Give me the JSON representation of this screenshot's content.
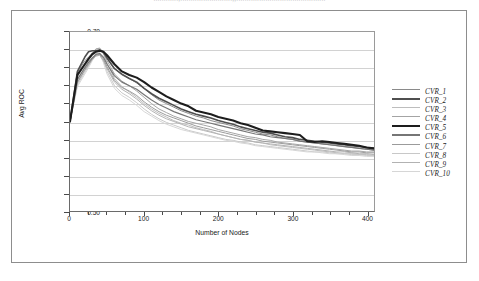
{
  "figure": {
    "caption_cutoff": "............,.........................,,..........................................."
  },
  "chart_data": {
    "type": "line",
    "title": "",
    "xlabel": "Number of Nodes",
    "ylabel": "Avg ROC",
    "xlim": [
      0,
      410
    ],
    "ylim": [
      0.5,
      0.7
    ],
    "ytick_values": [
      0.5,
      0.52,
      0.54,
      0.56,
      0.58,
      0.6,
      0.62,
      0.64,
      0.66,
      0.68,
      0.7
    ],
    "ytick_labels": [
      "0.50",
      "0.52",
      "0.54",
      "0.56",
      "0.58",
      "0.60",
      "0.62",
      "0.64",
      "0.66",
      "0.68",
      "0.70"
    ],
    "xtick_values": [
      0,
      100,
      200,
      300,
      400
    ],
    "xtick_labels": [
      "0",
      "100",
      "200",
      "300",
      "400"
    ],
    "xminor_step": 25,
    "grid": "horizontal",
    "legend_position": "right",
    "legend_entries": [
      "CVR_1",
      "CVR_2",
      "CVR_3",
      "CVR_4",
      "CVR_5",
      "CVR_6",
      "CVR_7",
      "CVR_8",
      "CVR_9",
      "CVR_10"
    ],
    "x": [
      0,
      10,
      20,
      25,
      30,
      35,
      40,
      45,
      50,
      60,
      70,
      80,
      90,
      100,
      110,
      120,
      130,
      140,
      150,
      160,
      170,
      180,
      190,
      200,
      210,
      220,
      230,
      240,
      250,
      260,
      270,
      280,
      290,
      300,
      310,
      320,
      330,
      340,
      350,
      360,
      370,
      380,
      390,
      400,
      410
    ],
    "series": [
      {
        "name": "CVR_1",
        "color": "#8a8a8a",
        "width": 1.0,
        "values": [
          0.6,
          0.655,
          0.668,
          0.672,
          0.676,
          0.679,
          0.68,
          0.676,
          0.67,
          0.659,
          0.652,
          0.648,
          0.643,
          0.637,
          0.63,
          0.624,
          0.62,
          0.616,
          0.612,
          0.609,
          0.606,
          0.604,
          0.601,
          0.599,
          0.597,
          0.595,
          0.592,
          0.59,
          0.588,
          0.586,
          0.585,
          0.583,
          0.581,
          0.58,
          0.578,
          0.577,
          0.576,
          0.575,
          0.574,
          0.573,
          0.572,
          0.571,
          0.57,
          0.569,
          0.568
        ]
      },
      {
        "name": "CVR_2",
        "color": "#4f4f4f",
        "width": 1.6,
        "values": [
          0.6,
          0.656,
          0.672,
          0.678,
          0.679,
          0.679,
          0.68,
          0.678,
          0.671,
          0.659,
          0.653,
          0.648,
          0.644,
          0.637,
          0.631,
          0.626,
          0.622,
          0.618,
          0.614,
          0.611,
          0.608,
          0.606,
          0.604,
          0.601,
          0.599,
          0.597,
          0.594,
          0.592,
          0.59,
          0.588,
          0.587,
          0.585,
          0.583,
          0.582,
          0.58,
          0.579,
          0.578,
          0.577,
          0.576,
          0.575,
          0.574,
          0.573,
          0.572,
          0.571,
          0.57
        ]
      },
      {
        "name": "CVR_3",
        "color": "#bdbdbd",
        "width": 1.0,
        "values": [
          0.6,
          0.646,
          0.661,
          0.668,
          0.676,
          0.681,
          0.682,
          0.676,
          0.665,
          0.648,
          0.639,
          0.633,
          0.627,
          0.62,
          0.614,
          0.609,
          0.605,
          0.601,
          0.598,
          0.596,
          0.593,
          0.591,
          0.589,
          0.586,
          0.584,
          0.582,
          0.58,
          0.579,
          0.577,
          0.576,
          0.574,
          0.573,
          0.572,
          0.571,
          0.57,
          0.569,
          0.568,
          0.567,
          0.566,
          0.565,
          0.564,
          0.564,
          0.563,
          0.563,
          0.562
        ]
      },
      {
        "name": "CVR_4",
        "color": "#a4a4a4",
        "width": 1.0,
        "values": [
          0.6,
          0.65,
          0.665,
          0.671,
          0.677,
          0.681,
          0.682,
          0.677,
          0.668,
          0.653,
          0.645,
          0.64,
          0.634,
          0.627,
          0.62,
          0.614,
          0.61,
          0.606,
          0.603,
          0.6,
          0.598,
          0.596,
          0.594,
          0.591,
          0.589,
          0.587,
          0.585,
          0.583,
          0.582,
          0.58,
          0.579,
          0.577,
          0.576,
          0.575,
          0.574,
          0.573,
          0.572,
          0.571,
          0.57,
          0.569,
          0.568,
          0.567,
          0.567,
          0.566,
          0.566
        ]
      },
      {
        "name": "CVR_5",
        "color": "#1d1d1d",
        "width": 2.1,
        "values": [
          0.6,
          0.652,
          0.664,
          0.67,
          0.675,
          0.678,
          0.679,
          0.678,
          0.674,
          0.664,
          0.656,
          0.652,
          0.649,
          0.644,
          0.638,
          0.633,
          0.628,
          0.624,
          0.62,
          0.617,
          0.612,
          0.61,
          0.608,
          0.605,
          0.603,
          0.601,
          0.598,
          0.596,
          0.593,
          0.59,
          0.589,
          0.588,
          0.587,
          0.586,
          0.585,
          0.578,
          0.577,
          0.578,
          0.577,
          0.576,
          0.575,
          0.574,
          0.573,
          0.571,
          0.57
        ]
      },
      {
        "name": "CVR_6",
        "color": "#767676",
        "width": 1.2,
        "values": [
          0.6,
          0.647,
          0.66,
          0.666,
          0.671,
          0.675,
          0.676,
          0.672,
          0.664,
          0.651,
          0.644,
          0.64,
          0.636,
          0.63,
          0.624,
          0.619,
          0.615,
          0.611,
          0.608,
          0.605,
          0.602,
          0.6,
          0.598,
          0.596,
          0.594,
          0.592,
          0.59,
          0.588,
          0.586,
          0.585,
          0.583,
          0.582,
          0.581,
          0.58,
          0.578,
          0.577,
          0.576,
          0.575,
          0.574,
          0.573,
          0.572,
          0.571,
          0.57,
          0.569,
          0.568
        ]
      },
      {
        "name": "CVR_7",
        "color": "#9b9b9b",
        "width": 1.0,
        "values": [
          0.6,
          0.644,
          0.658,
          0.664,
          0.67,
          0.674,
          0.675,
          0.67,
          0.661,
          0.646,
          0.638,
          0.634,
          0.629,
          0.622,
          0.616,
          0.611,
          0.607,
          0.604,
          0.601,
          0.598,
          0.595,
          0.593,
          0.591,
          0.589,
          0.587,
          0.585,
          0.583,
          0.581,
          0.58,
          0.578,
          0.577,
          0.576,
          0.575,
          0.574,
          0.573,
          0.572,
          0.571,
          0.57,
          0.569,
          0.568,
          0.567,
          0.566,
          0.566,
          0.565,
          0.565
        ]
      },
      {
        "name": "CVR_8",
        "color": "#c8c8c8",
        "width": 1.0,
        "values": [
          0.6,
          0.641,
          0.655,
          0.662,
          0.67,
          0.676,
          0.677,
          0.669,
          0.656,
          0.64,
          0.632,
          0.627,
          0.621,
          0.614,
          0.608,
          0.603,
          0.599,
          0.596,
          0.593,
          0.59,
          0.588,
          0.586,
          0.584,
          0.582,
          0.58,
          0.579,
          0.577,
          0.576,
          0.574,
          0.573,
          0.572,
          0.571,
          0.57,
          0.569,
          0.568,
          0.567,
          0.566,
          0.566,
          0.565,
          0.564,
          0.564,
          0.563,
          0.563,
          0.562,
          0.562
        ]
      },
      {
        "name": "CVR_9",
        "color": "#b2b2b2",
        "width": 1.0,
        "values": [
          0.6,
          0.643,
          0.657,
          0.663,
          0.669,
          0.673,
          0.674,
          0.668,
          0.659,
          0.644,
          0.636,
          0.631,
          0.625,
          0.618,
          0.612,
          0.607,
          0.603,
          0.6,
          0.597,
          0.594,
          0.592,
          0.59,
          0.588,
          0.586,
          0.584,
          0.582,
          0.58,
          0.579,
          0.577,
          0.576,
          0.575,
          0.574,
          0.573,
          0.572,
          0.571,
          0.57,
          0.569,
          0.568,
          0.567,
          0.566,
          0.566,
          0.565,
          0.564,
          0.564,
          0.563
        ]
      },
      {
        "name": "CVR_10",
        "color": "#d6d6d6",
        "width": 1.0,
        "values": [
          0.6,
          0.639,
          0.653,
          0.66,
          0.668,
          0.674,
          0.675,
          0.666,
          0.653,
          0.637,
          0.629,
          0.624,
          0.618,
          0.611,
          0.606,
          0.601,
          0.597,
          0.594,
          0.591,
          0.589,
          0.587,
          0.585,
          0.583,
          0.581,
          0.579,
          0.578,
          0.576,
          0.575,
          0.573,
          0.572,
          0.571,
          0.57,
          0.569,
          0.568,
          0.567,
          0.566,
          0.566,
          0.565,
          0.564,
          0.564,
          0.563,
          0.562,
          0.562,
          0.561,
          0.561
        ]
      }
    ]
  }
}
